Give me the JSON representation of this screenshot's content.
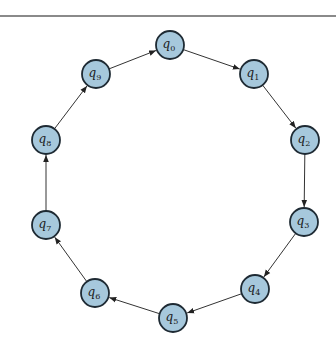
{
  "diagram": {
    "type": "cycle-graph",
    "directed": true,
    "node_radius": 14,
    "colors": {
      "node_fill": "#a6c8dc",
      "node_stroke": "#1e2a33",
      "edge": "#333333"
    },
    "nodes": [
      {
        "id": "q0",
        "base": "q",
        "sub": "0",
        "x": 170,
        "y": 45
      },
      {
        "id": "q1",
        "base": "q",
        "sub": "1",
        "x": 254,
        "y": 74
      },
      {
        "id": "q2",
        "base": "q",
        "sub": "2",
        "x": 305,
        "y": 140
      },
      {
        "id": "q3",
        "base": "q",
        "sub": "3",
        "x": 304,
        "y": 222
      },
      {
        "id": "q4",
        "base": "q",
        "sub": "4",
        "x": 255,
        "y": 289
      },
      {
        "id": "q5",
        "base": "q",
        "sub": "5",
        "x": 173,
        "y": 318
      },
      {
        "id": "q6",
        "base": "q",
        "sub": "6",
        "x": 95,
        "y": 293
      },
      {
        "id": "q7",
        "base": "q",
        "sub": "7",
        "x": 46,
        "y": 225
      },
      {
        "id": "q8",
        "base": "q",
        "sub": "8",
        "x": 46,
        "y": 140
      },
      {
        "id": "q9",
        "base": "q",
        "sub": "9",
        "x": 96,
        "y": 74
      }
    ],
    "edges": [
      {
        "from": "q0",
        "to": "q1"
      },
      {
        "from": "q1",
        "to": "q2"
      },
      {
        "from": "q2",
        "to": "q3"
      },
      {
        "from": "q3",
        "to": "q4"
      },
      {
        "from": "q4",
        "to": "q5"
      },
      {
        "from": "q5",
        "to": "q6"
      },
      {
        "from": "q6",
        "to": "q7"
      },
      {
        "from": "q7",
        "to": "q8"
      },
      {
        "from": "q8",
        "to": "q9"
      },
      {
        "from": "q9",
        "to": "q0"
      }
    ]
  }
}
